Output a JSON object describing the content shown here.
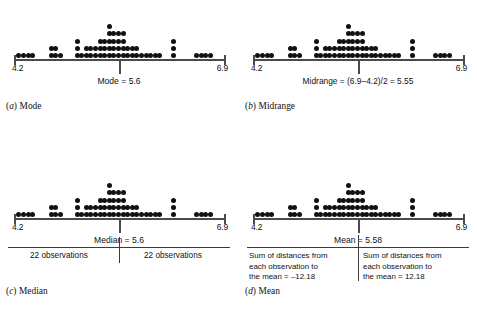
{
  "figure": {
    "axis": {
      "min_label": "4.2",
      "max_label": "6.9",
      "min": 4.2,
      "max": 6.9
    }
  },
  "chart_data": {
    "type": "dotplot",
    "xlabel": "",
    "ylabel": "",
    "xlim": [
      4.2,
      6.9
    ],
    "grid": false,
    "legend": "none",
    "n_observations": 44,
    "bin_width": 0.06,
    "stack_heights": [
      1,
      1,
      1,
      1,
      0,
      0,
      2,
      2,
      1,
      0,
      0,
      3,
      1,
      2,
      2,
      2,
      3,
      3,
      5,
      4,
      4,
      4,
      2,
      2,
      2,
      1,
      1,
      1,
      1,
      1,
      3,
      0,
      1,
      1,
      1,
      1
    ],
    "columns": [
      {
        "x": 4.23,
        "count": 1
      },
      {
        "x": 4.29,
        "count": 1
      },
      {
        "x": 4.35,
        "count": 1
      },
      {
        "x": 4.41,
        "count": 1
      },
      {
        "x": 4.65,
        "count": 2
      },
      {
        "x": 4.71,
        "count": 2
      },
      {
        "x": 4.77,
        "count": 1
      },
      {
        "x": 4.99,
        "count": 3
      },
      {
        "x": 5.05,
        "count": 1
      },
      {
        "x": 5.11,
        "count": 2
      },
      {
        "x": 5.17,
        "count": 2
      },
      {
        "x": 5.23,
        "count": 2
      },
      {
        "x": 5.29,
        "count": 3
      },
      {
        "x": 5.35,
        "count": 3
      },
      {
        "x": 5.41,
        "count": 5
      },
      {
        "x": 5.47,
        "count": 4
      },
      {
        "x": 5.53,
        "count": 4
      },
      {
        "x": 5.59,
        "count": 4
      },
      {
        "x": 5.65,
        "count": 2
      },
      {
        "x": 5.71,
        "count": 2
      },
      {
        "x": 5.77,
        "count": 2
      },
      {
        "x": 5.83,
        "count": 1
      },
      {
        "x": 5.89,
        "count": 1
      },
      {
        "x": 5.95,
        "count": 1
      },
      {
        "x": 6.01,
        "count": 1
      },
      {
        "x": 6.07,
        "count": 1
      },
      {
        "x": 6.25,
        "count": 3
      },
      {
        "x": 6.55,
        "count": 1
      },
      {
        "x": 6.61,
        "count": 1
      },
      {
        "x": 6.67,
        "count": 1
      },
      {
        "x": 6.73,
        "count": 1
      }
    ],
    "statistics": {
      "mode": 5.6,
      "midrange": 5.55,
      "median": 5.6,
      "mean": 5.58,
      "observations_below_median": 22,
      "observations_above_median": 22,
      "sum_negative_deviations": -12.18,
      "sum_positive_deviations": 12.18
    }
  },
  "panels": {
    "a": {
      "stat_label": "Mode = 5.6",
      "caption_letter": "a",
      "caption_text": "Mode",
      "pointer_position_pct": 50
    },
    "b": {
      "stat_label": "Midrange = (6.9–4.2)/2 = 5.55",
      "caption_letter": "b",
      "caption_text": "Midrange",
      "pointer_position_pct": 50
    },
    "c": {
      "stat_label": "Median = 5.6",
      "caption_letter": "c",
      "caption_text": "Median",
      "pointer_position_pct": 50,
      "left_note": "22 observations",
      "right_note": "22 observations"
    },
    "d": {
      "stat_label": "Mean = 5.58",
      "caption_letter": "d",
      "caption_text": "Mean",
      "pointer_position_pct": 50,
      "left_note_line1": "Sum of distances from",
      "left_note_line2": "each observation to",
      "left_note_line3": "the mean = –12.18",
      "right_note_line1": "Sum of distances from",
      "right_note_line2": "each observation to",
      "right_note_line3": "the mean = 12.18"
    }
  },
  "colors": {
    "dot": "#111111",
    "axis": "#4a4a4a",
    "text": "#111111",
    "background": "#ffffff"
  }
}
